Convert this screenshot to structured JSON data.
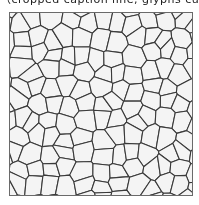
{
  "caption": {
    "text": "（cropped caption line, glyphs cut off at top edge）",
    "visible": "partially"
  },
  "figure": {
    "colors": {
      "background": "#f4f4f4",
      "boundary": "#3a3a3a",
      "frame": "#6a6a6a"
    },
    "frame": {
      "x": 9,
      "y": 12,
      "width": 184,
      "height": 184
    },
    "grid": {
      "cols": 11,
      "rows": 11,
      "jitter": 0.38,
      "seed": 17
    }
  }
}
